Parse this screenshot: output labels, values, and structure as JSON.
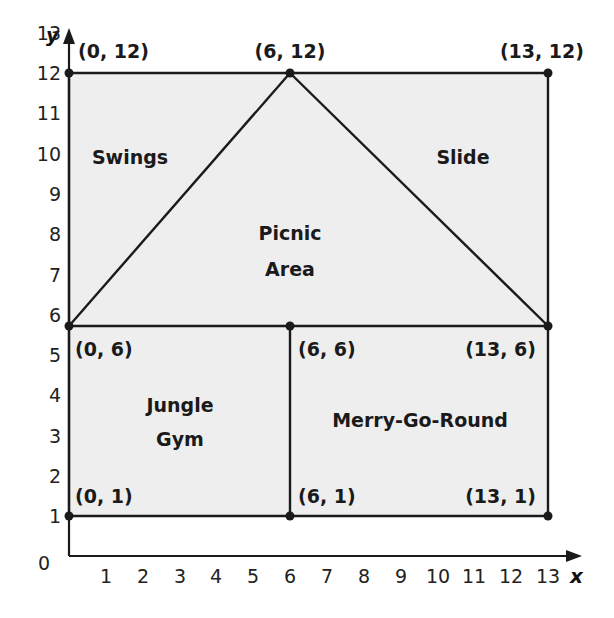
{
  "diagram": {
    "type": "coordinate-plane-map",
    "fill_color": "#eeeeee",
    "line_color": "#1a1a1a",
    "axes": {
      "x_label": "x",
      "y_label": "y",
      "origin_label": "0",
      "x_ticks": [
        "1",
        "2",
        "3",
        "4",
        "5",
        "6",
        "7",
        "8",
        "9",
        "10",
        "11",
        "12",
        "13"
      ],
      "y_ticks": [
        "1",
        "2",
        "3",
        "4",
        "5",
        "6",
        "7",
        "8",
        "9",
        "10",
        "11",
        "12",
        "13"
      ]
    },
    "points": [
      {
        "label": "(0, 12)",
        "x": 0,
        "y": 12
      },
      {
        "label": "(6, 12)",
        "x": 6,
        "y": 12
      },
      {
        "label": "(13, 12)",
        "x": 13,
        "y": 12
      },
      {
        "label": "(0, 6)",
        "x": 0,
        "y": 6
      },
      {
        "label": "(6, 6)",
        "x": 6,
        "y": 6
      },
      {
        "label": "(13, 6)",
        "x": 13,
        "y": 6
      },
      {
        "label": "(0, 1)",
        "x": 0,
        "y": 1
      },
      {
        "label": "(6, 1)",
        "x": 6,
        "y": 1
      },
      {
        "label": "(13, 1)",
        "x": 13,
        "y": 1
      }
    ],
    "regions": {
      "swings": "Swings",
      "slide": "Slide",
      "picnic_line1": "Picnic",
      "picnic_line2": "Area",
      "jungle_line1": "Jungle",
      "jungle_line2": "Gym",
      "merry_go_round": "Merry-Go-Round"
    }
  }
}
